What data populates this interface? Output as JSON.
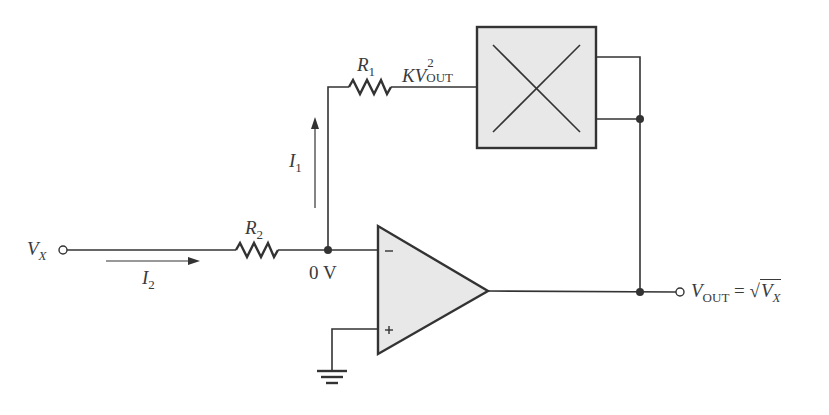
{
  "diagram": {
    "colors": {
      "wire": "#333333",
      "fill": "#e8e8e8",
      "text": "#3a3a3a"
    },
    "input": {
      "label_main": "V",
      "label_sub": "X"
    },
    "resistor_r2": {
      "label_main": "R",
      "label_sub": "2"
    },
    "resistor_r1": {
      "label_main": "R",
      "label_sub": "1"
    },
    "current_i2": {
      "label_main": "I",
      "label_sub": "2"
    },
    "current_i1": {
      "label_main": "I",
      "label_sub": "1"
    },
    "node_voltage": "0 V",
    "multiplier_output": {
      "label_main": "KV",
      "label_sup": "2",
      "label_sub": "OUT"
    },
    "opamp": {
      "inverting": "−",
      "noninverting": "+"
    },
    "output": {
      "label_main": "V",
      "label_sub": "OUT",
      "equals": "=",
      "sqrt": "√",
      "rhs_main": "V",
      "rhs_sub": "X"
    }
  }
}
